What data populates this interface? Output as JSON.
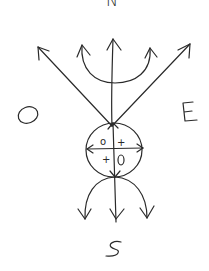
{
  "diagram": {
    "type": "hand-drawn compass / direction sketch",
    "labels": {
      "north": "N",
      "west": "O",
      "east": "E",
      "south": "S"
    },
    "circle_quadrants": {
      "top_left": "o",
      "top_right": "+",
      "bottom_left": "+",
      "bottom_right": "o"
    },
    "stroke_color": "#2a2a2a",
    "background": "#ffffff"
  }
}
